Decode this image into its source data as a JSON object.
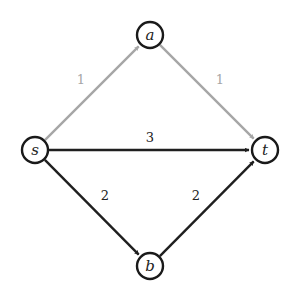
{
  "graph": {
    "nodes": [
      {
        "id": "s",
        "label": "s",
        "x": 35,
        "y": 150
      },
      {
        "id": "a",
        "label": "a",
        "x": 150,
        "y": 35
      },
      {
        "id": "t",
        "label": "t",
        "x": 265,
        "y": 150
      },
      {
        "id": "b",
        "label": "b",
        "x": 150,
        "y": 266
      }
    ],
    "edges": [
      {
        "from": "s",
        "to": "a",
        "label": "1",
        "color": "#a6a6a6",
        "label_x": 81,
        "label_y": 84
      },
      {
        "from": "a",
        "to": "t",
        "label": "1",
        "color": "#a6a6a6",
        "label_x": 220,
        "label_y": 84
      },
      {
        "from": "s",
        "to": "t",
        "label": "3",
        "color": "#1f1f1f",
        "label_x": 150,
        "label_y": 142
      },
      {
        "from": "s",
        "to": "b",
        "label": "2",
        "color": "#1f1f1f",
        "label_x": 105,
        "label_y": 200
      },
      {
        "from": "b",
        "to": "t",
        "label": "2",
        "color": "#1f1f1f",
        "label_x": 196,
        "label_y": 200
      }
    ],
    "node_radius": 13
  }
}
